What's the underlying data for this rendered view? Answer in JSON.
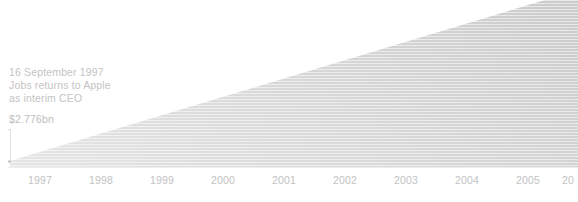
{
  "chart_data": {
    "type": "area",
    "title": "",
    "subtitle": "",
    "xlabel": "",
    "ylabel": "",
    "grid": false,
    "legend_position": "none",
    "x_tick_labels": [
      "1997",
      "1998",
      "1999",
      "2000",
      "2001",
      "2002",
      "2003",
      "2004",
      "2005",
      "20"
    ],
    "x_tick_positions_px": [
      88,
      284,
      480,
      676,
      872,
      1068,
      1264,
      1460,
      1656,
      1852
    ],
    "categories": [
      "1997",
      "1998",
      "1999",
      "2000",
      "2001",
      "2002",
      "2003",
      "2004",
      "2005",
      "2006"
    ],
    "values": [
      2.776,
      10.3,
      18.1,
      25.9,
      33.7,
      41.5,
      49.3,
      57.1,
      64.9,
      72.0
    ],
    "series": [
      {
        "name": "Apple market value",
        "units": "$bn",
        "values": [
          2.776,
          10.3,
          18.1,
          25.9,
          33.7,
          41.5,
          49.3,
          57.1,
          64.9,
          72.0
        ]
      }
    ],
    "ylim": [
      0,
      75
    ],
    "annotations": [
      {
        "name": "jobs-returns-annotation",
        "date": "16 September 1997",
        "line1": "16 September 1997",
        "line2": "Jobs returns to Apple",
        "line3": "as interim CEO",
        "value_label": "$2.776bn",
        "value": 2.776
      }
    ]
  },
  "annotation": {
    "line1": "16 September 1997",
    "line2": "Jobs returns to Apple",
    "line3": "as interim CEO",
    "value_label": "$2.776bn"
  },
  "axis": {
    "x_labels": [
      {
        "text": "1997",
        "left": 28
      },
      {
        "text": "1998",
        "left": 89
      },
      {
        "text": "1999",
        "left": 150
      },
      {
        "text": "2000",
        "left": 211
      },
      {
        "text": "2001",
        "left": 272
      },
      {
        "text": "2002",
        "left": 333
      },
      {
        "text": "2003",
        "left": 394
      },
      {
        "text": "2004",
        "left": 455
      },
      {
        "text": "2005",
        "left": 516
      },
      {
        "text": "20",
        "left": 562
      }
    ]
  },
  "colors": {
    "background": "#ffffff",
    "area_fill_top": "#cfcfcf",
    "area_fill_bottom": "#e2e2e2",
    "axis_line": "#ededed",
    "text_muted": "#c4c4c4",
    "value_text": "#bdbdbd"
  }
}
